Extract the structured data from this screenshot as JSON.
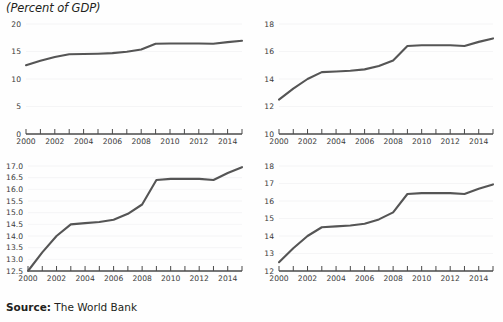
{
  "header": {
    "axis_title": "(Percent of GDP)"
  },
  "footer": {
    "source_label": "Source:",
    "source_value": " The World Bank"
  },
  "chart_data": [
    {
      "id": "chart-top-left",
      "type": "line",
      "title": "",
      "xlabel": "",
      "ylabel": "",
      "x": [
        2000,
        2001,
        2002,
        2003,
        2004,
        2005,
        2006,
        2007,
        2008,
        2009,
        2010,
        2011,
        2012,
        2013,
        2014,
        2015
      ],
      "values": [
        12.5,
        13.3,
        14.0,
        14.5,
        14.55,
        14.6,
        14.7,
        14.95,
        15.35,
        16.4,
        16.45,
        16.45,
        16.45,
        16.4,
        16.7,
        16.95
      ],
      "ylim": [
        0,
        20
      ],
      "yticks": [
        0,
        5,
        10,
        15,
        20
      ],
      "ytick_labels": [
        "0",
        "5",
        "10",
        "15",
        "20"
      ],
      "xticks": [
        2000,
        2001,
        2002,
        2003,
        2004,
        2005,
        2006,
        2007,
        2008,
        2009,
        2010,
        2011,
        2012,
        2013,
        2014,
        2015
      ],
      "xtick_labels": [
        "2000",
        "",
        "2002",
        "",
        "2004",
        "",
        "2006",
        "",
        "2008",
        "",
        "2010",
        "",
        "2012",
        "",
        "2014",
        ""
      ],
      "grid": true,
      "legend": "none",
      "line_color": "#555555"
    },
    {
      "id": "chart-top-right",
      "type": "line",
      "title": "",
      "xlabel": "",
      "ylabel": "",
      "x": [
        2000,
        2001,
        2002,
        2003,
        2004,
        2005,
        2006,
        2007,
        2008,
        2009,
        2010,
        2011,
        2012,
        2013,
        2014,
        2015
      ],
      "values": [
        12.5,
        13.3,
        14.0,
        14.5,
        14.55,
        14.6,
        14.7,
        14.95,
        15.35,
        16.4,
        16.45,
        16.45,
        16.45,
        16.4,
        16.7,
        16.95
      ],
      "ylim": [
        10,
        18
      ],
      "yticks": [
        10,
        12,
        14,
        16,
        18
      ],
      "ytick_labels": [
        "10",
        "12",
        "14",
        "16",
        "18"
      ],
      "xticks": [
        2000,
        2001,
        2002,
        2003,
        2004,
        2005,
        2006,
        2007,
        2008,
        2009,
        2010,
        2011,
        2012,
        2013,
        2014,
        2015
      ],
      "xtick_labels": [
        "2000",
        "",
        "2002",
        "",
        "2004",
        "",
        "2006",
        "",
        "2008",
        "",
        "2010",
        "",
        "2012",
        "",
        "2014",
        ""
      ],
      "grid": true,
      "legend": "none",
      "line_color": "#555555"
    },
    {
      "id": "chart-bottom-left",
      "type": "line",
      "title": "",
      "xlabel": "",
      "ylabel": "",
      "x": [
        2000,
        2001,
        2002,
        2003,
        2004,
        2005,
        2006,
        2007,
        2008,
        2009,
        2010,
        2011,
        2012,
        2013,
        2014,
        2015
      ],
      "values": [
        12.5,
        13.3,
        14.0,
        14.5,
        14.55,
        14.6,
        14.7,
        14.95,
        15.35,
        16.4,
        16.45,
        16.45,
        16.45,
        16.4,
        16.7,
        16.95
      ],
      "ylim": [
        12.5,
        17.0
      ],
      "yticks": [
        12.5,
        13.0,
        13.5,
        14.0,
        14.5,
        15.0,
        15.5,
        16.0,
        16.5,
        17.0
      ],
      "ytick_labels": [
        "12.5",
        "13.0",
        "13.5",
        "14.0",
        "14.5",
        "15.0",
        "15.5",
        "16.0",
        "16.5",
        "17.0"
      ],
      "xticks": [
        2000,
        2001,
        2002,
        2003,
        2004,
        2005,
        2006,
        2007,
        2008,
        2009,
        2010,
        2011,
        2012,
        2013,
        2014,
        2015
      ],
      "xtick_labels": [
        "2000",
        "",
        "2002",
        "",
        "2004",
        "",
        "2006",
        "",
        "2008",
        "",
        "2010",
        "",
        "2012",
        "",
        "2014",
        ""
      ],
      "grid": true,
      "legend": "none",
      "line_color": "#555555"
    },
    {
      "id": "chart-bottom-right",
      "type": "line",
      "title": "",
      "xlabel": "",
      "ylabel": "",
      "x": [
        2000,
        2001,
        2002,
        2003,
        2004,
        2005,
        2006,
        2007,
        2008,
        2009,
        2010,
        2011,
        2012,
        2013,
        2014,
        2015
      ],
      "values": [
        12.5,
        13.3,
        14.0,
        14.5,
        14.55,
        14.6,
        14.7,
        14.95,
        15.35,
        16.4,
        16.45,
        16.45,
        16.45,
        16.4,
        16.7,
        16.95
      ],
      "ylim": [
        12,
        18
      ],
      "yticks": [
        12,
        13,
        14,
        15,
        16,
        17,
        18
      ],
      "ytick_labels": [
        "12",
        "13",
        "14",
        "15",
        "16",
        "17",
        "18"
      ],
      "xticks": [
        2000,
        2001,
        2002,
        2003,
        2004,
        2005,
        2006,
        2007,
        2008,
        2009,
        2010,
        2011,
        2012,
        2013,
        2014,
        2015
      ],
      "xtick_labels": [
        "2000",
        "",
        "2002",
        "",
        "2004",
        "",
        "2006",
        "",
        "2008",
        "",
        "2010",
        "",
        "2012",
        "",
        "2014",
        ""
      ],
      "grid": true,
      "legend": "none",
      "line_color": "#555555"
    }
  ]
}
